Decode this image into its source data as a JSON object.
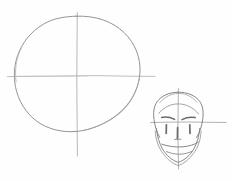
{
  "page": {
    "medium": "graphite pencil on white paper",
    "background_color": "#fefefe",
    "width": 232,
    "height": 181
  },
  "palette": {
    "paper": "#fefefe",
    "guideline_gray": "#b6b6b6",
    "light_pencil": "#a8a8a8",
    "mid_pencil": "#8f8f8f",
    "dark_pencil": "#6e6e6e"
  },
  "figures": [
    {
      "id": "construction-sphere",
      "label": "Large construction circle with crosshair guidelines",
      "description": "Step one of head construction: a freehand sphere marked with a vertical centre line and a horizontal eye line.",
      "parts": [
        {
          "name": "sphere-outline",
          "label": "Sphere outline",
          "stroke": "#8f8f8f",
          "width": 0.9
        },
        {
          "name": "vertical-center-line",
          "label": "Vertical centre line",
          "stroke": "#b0b0b0",
          "width": 0.9
        },
        {
          "name": "horizontal-eye-line",
          "label": "Horizontal eye line",
          "stroke": "#b0b0b0",
          "width": 0.9
        }
      ],
      "geometry": {
        "center_x": 77,
        "center_y": 75,
        "radius_x": 63,
        "radius_y": 59,
        "vertical_line": {
          "x": 77,
          "y1": 12,
          "y2": 156
        },
        "horizontal_line": {
          "y": 76,
          "x1": 7,
          "x2": 155
        }
      }
    },
    {
      "id": "constructed-head",
      "label": "Small finished head with facial features",
      "description": "Step two: the same construction applied at small scale with jaw, brows, eyes, nose and mouth blocked in.",
      "parts": [
        {
          "name": "cranium-outline",
          "label": "Cranium outline",
          "stroke": "#7e7e7e",
          "width": 0.9
        },
        {
          "name": "jaw-outline",
          "label": "Jaw and chin outline",
          "stroke": "#7e7e7e",
          "width": 0.9
        },
        {
          "name": "vertical-center-line",
          "label": "Vertical centre line",
          "stroke": "#a8a8a8",
          "width": 0.9
        },
        {
          "name": "horizontal-eye-line",
          "label": "Horizontal eye line",
          "stroke": "#a8a8a8",
          "width": 0.9
        },
        {
          "name": "left-eyebrow",
          "label": "Left eyebrow",
          "stroke": "#6e6e6e",
          "width": 1.3
        },
        {
          "name": "right-eyebrow",
          "label": "Right eyebrow",
          "stroke": "#6e6e6e",
          "width": 1.3
        },
        {
          "name": "left-eye",
          "label": "Left eye mark",
          "stroke": "#6e6e6e",
          "width": 1.6
        },
        {
          "name": "right-eye",
          "label": "Right eye mark",
          "stroke": "#6e6e6e",
          "width": 1.6
        },
        {
          "name": "nose",
          "label": "Nose mark",
          "stroke": "#6e6e6e",
          "width": 1.6
        },
        {
          "name": "mouth-line",
          "label": "Mouth line",
          "stroke": "#7e7e7e",
          "width": 0.9
        },
        {
          "name": "chin-line",
          "label": "Chin line",
          "stroke": "#7e7e7e",
          "width": 0.9
        }
      ],
      "geometry": {
        "center_x": 178,
        "eye_line_y": 122,
        "cranium": {
          "cx": 178,
          "cy": 117,
          "rx": 24,
          "ry": 25
        },
        "chin_y": 162,
        "vertical_line": {
          "x": 178,
          "y1": 88,
          "y2": 169
        },
        "horizontal_line": {
          "y": 122,
          "x1": 150,
          "x2": 226
        }
      }
    }
  ]
}
